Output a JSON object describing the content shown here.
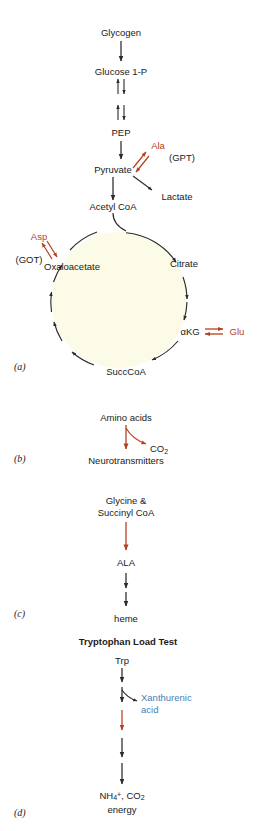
{
  "figure": {
    "background_color": "#ffffff",
    "colors": {
      "text": "#1a1a1a",
      "arrow_black": "#2b2b2b",
      "arrow_red": "#b5401f",
      "accent_red": "#b5401f",
      "accent_blue": "#4a80b4",
      "cycle_fill": "#fbfbe8",
      "cycle_stroke": "#2b2b2b"
    },
    "panels": [
      {
        "id": "a",
        "label": "(a)",
        "name": "panel-a-glycolysis-tca"
      },
      {
        "id": "b",
        "label": "(b)",
        "name": "panel-b-neurotransmitters"
      },
      {
        "id": "c",
        "label": "(c)",
        "name": "panel-c-heme-synthesis"
      },
      {
        "id": "d",
        "label": "(d)",
        "name": "panel-d-tryptophan-load-test"
      }
    ]
  },
  "panel_a": {
    "nodes": {
      "glycogen": "Glycogen",
      "glucose_1p": "Glucose 1-P",
      "pep": "PEP",
      "pyruvate": "Pyruvate",
      "lactate": "Lactate",
      "acetyl_coa": "Acetyl CoA",
      "oxaloacetate": "Oxaloacetate",
      "citrate": "Citrate",
      "akg": "αKG",
      "succcoa": "SuccCoA"
    },
    "cofactors": {
      "ala": "Ala",
      "gpt": "(GPT)",
      "asp": "Asp",
      "got": "(GOT)",
      "glu": "Glu"
    }
  },
  "panel_b": {
    "nodes": {
      "amino_acids": "Amino acids",
      "neurotransmitters": "Neurotransmitters"
    },
    "byproducts": {
      "co2_text": "CO",
      "co2_sub": "2"
    }
  },
  "panel_c": {
    "nodes": {
      "precursors_line1": "Glycine &",
      "precursors_line2": "Succinyl CoA",
      "ala": "ALA",
      "heme": "heme"
    }
  },
  "panel_d": {
    "heading": "Tryptophan Load Test",
    "nodes": {
      "trp": "Trp",
      "xanthurenic_line1": "Xanthurenic",
      "xanthurenic_line2": "acid",
      "products_nh4": "NH",
      "products_nh4_sub": "4",
      "products_nh4_sup": "+",
      "products_sep": ", CO",
      "products_co2_sub": "2",
      "products_energy": "energy"
    }
  }
}
